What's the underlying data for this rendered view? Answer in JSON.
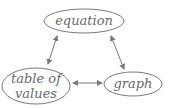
{
  "diagram": {
    "colors": {
      "stroke": "#7a7a7a",
      "text": "#6a6a6a",
      "background": "#ffffff"
    },
    "nodes": [
      {
        "id": "equation",
        "label": "equation",
        "lines": [
          "equation"
        ]
      },
      {
        "id": "table",
        "label": "table of values",
        "lines": [
          "table of",
          "values"
        ]
      },
      {
        "id": "graph",
        "label": "graph",
        "lines": [
          "graph"
        ]
      }
    ],
    "edges": [
      {
        "from": "equation",
        "to": "table",
        "direction": "bidirectional"
      },
      {
        "from": "equation",
        "to": "graph",
        "direction": "bidirectional"
      },
      {
        "from": "table",
        "to": "graph",
        "direction": "bidirectional"
      }
    ]
  }
}
